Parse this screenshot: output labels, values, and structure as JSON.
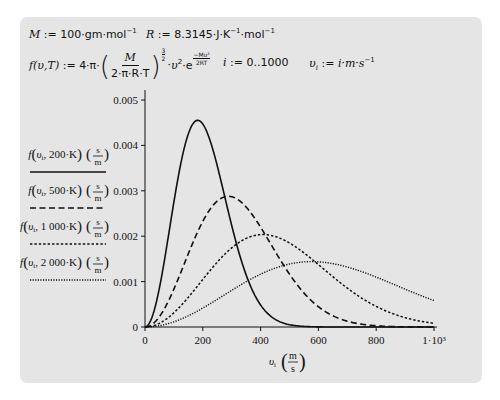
{
  "worksheet": {
    "definitions": {
      "M": {
        "name": "M",
        "assign": ":=",
        "value": "100",
        "units": "gm·mol",
        "exp": "−1"
      },
      "R": {
        "name": "R",
        "assign": ":=",
        "value": "8.3145",
        "units": "J·K",
        "exp1": "−1",
        "units2": "mol",
        "exp2": "−1"
      },
      "f": {
        "lhs": "f(υ,T)",
        "assign": ":=",
        "prefix": "4·π·",
        "frac_num": "M",
        "frac_den": "2·π·R·T",
        "power_num": "3",
        "power_den": "2",
        "mid": "·υ",
        "mid_exp": "2",
        "e": "·e",
        "exp_num": "−Mυ²",
        "exp_den": "2RT"
      },
      "i": {
        "name": "i",
        "assign": ":=",
        "range": "0..1000"
      },
      "v": {
        "name": "υ",
        "sub": "i",
        "assign": ":=",
        "value": "i·m·s",
        "exp": "−1"
      }
    }
  },
  "chart_data": {
    "type": "line",
    "title": "",
    "xlabel": "υᵢ (m/s)",
    "ylabel": "",
    "xlim": [
      0,
      1000
    ],
    "ylim": [
      0,
      0.005
    ],
    "grid": false,
    "legend_position": "left",
    "x_ticks": [
      "0",
      "200",
      "400",
      "600",
      "800",
      "1·10³"
    ],
    "x_tick_values": [
      0,
      200,
      400,
      600,
      800,
      1000
    ],
    "y_ticks": [
      "0",
      "0.001",
      "0.002",
      "0.003",
      "0.004",
      "0.005"
    ],
    "y_tick_values": [
      0,
      0.001,
      0.002,
      0.003,
      0.004,
      0.005
    ],
    "molar_mass_kg": 0.1,
    "R": 8.3145,
    "x": [
      0,
      100,
      200,
      300,
      400,
      500,
      600,
      700,
      800,
      900,
      1000
    ],
    "series": [
      {
        "name": "f(υᵢ, 200·K)(s/m)",
        "T": 200,
        "style": "solid",
        "dash": "",
        "width": 1.6,
        "values": [
          0,
          0.00265,
          0.00448,
          0.00281,
          0.00096,
          0.0002,
          3e-05,
          0,
          0,
          0,
          0
        ]
      },
      {
        "name": "f(υᵢ, 500·K)(s/m)",
        "T": 500,
        "style": "dashed",
        "dash": "6,3.5",
        "width": 1.6,
        "values": [
          0,
          0.00082,
          0.00239,
          0.00285,
          0.00238,
          0.00149,
          0.00073,
          0.00029,
          9e-05,
          2e-05,
          1e-05
        ]
      },
      {
        "name": "f(υᵢ, 1000·K)(s/m)",
        "T": 1000,
        "style": "dotted-dense",
        "dash": "2.4,2",
        "width": 1.5,
        "values": [
          0,
          0.00031,
          0.00101,
          0.00175,
          0.00203,
          0.0019,
          0.0015,
          0.00102,
          0.00061,
          0.00032,
          0.00015
        ]
      },
      {
        "name": "f(υᵢ, 2000·K)(s/m)",
        "T": 2000,
        "style": "dotted",
        "dash": "1.2,1.4",
        "width": 1.4,
        "values": [
          0,
          0.00011,
          0.0004,
          0.00081,
          0.00119,
          0.00142,
          0.00145,
          0.00134,
          0.00111,
          0.00085,
          0.0006
        ]
      }
    ]
  },
  "legend": [
    {
      "f": "f",
      "arg": "υ",
      "sub": "i",
      "temp": "200·K",
      "unit_num": "s",
      "unit_den": "m"
    },
    {
      "f": "f",
      "arg": "υ",
      "sub": "i",
      "temp": "500·K",
      "unit_num": "s",
      "unit_den": "m"
    },
    {
      "f": "f",
      "arg": "υ",
      "sub": "i",
      "temp": "1 000·K",
      "unit_num": "s",
      "unit_den": "m"
    },
    {
      "f": "f",
      "arg": "υ",
      "sub": "i",
      "temp": "2 000·K",
      "unit_num": "s",
      "unit_den": "m"
    }
  ],
  "x_axis_label": {
    "var": "υ",
    "sub": "i",
    "unit_num": "m",
    "unit_den": "s"
  }
}
